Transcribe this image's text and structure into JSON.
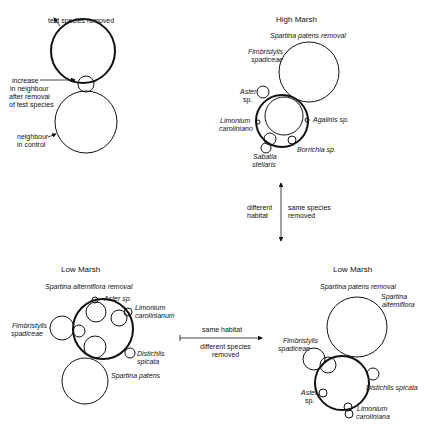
{
  "legend": {
    "test_species_removed": "test species removed",
    "increase_line1": "increase",
    "increase_line2": "in neighbour",
    "increase_line3": "after removal",
    "increase_line4": "of test species",
    "neighbour_line1": "neighbour",
    "neighbour_line2": "in control"
  },
  "high_marsh": {
    "title": "High Marsh",
    "removal": "Spartina patens removal",
    "species": {
      "fimbristylis_1": "Fimbristylis",
      "fimbristylis_2": "spadiceae",
      "aster_1": "Aster",
      "aster_2": "sp.",
      "limonium_1": "Limonium",
      "limonium_2": "caroliniano",
      "agalinis": "Agalinis  sp.",
      "borrichia": "Borrichia  sp.",
      "sabatia_1": "Sabatia",
      "sabatia_2": "stellaris"
    }
  },
  "vertical_arrow": {
    "left_1": "different",
    "left_2": "habitat",
    "right_1": "same species",
    "right_2": "removed"
  },
  "horizontal_arrow": {
    "top": "same habitat",
    "bottom_1": "different species",
    "bottom_2": "removed"
  },
  "low_marsh_left": {
    "title": "Low  Marsh",
    "removal": "Spartina alterniflora removal",
    "species": {
      "aster": "Aster  sp.",
      "limonium_1": "Limonium",
      "limonium_2": "carolinianum",
      "fimbristylis_1": "Fimbristylis",
      "fimbristylis_2": "spadiceae",
      "distichlis_1": "Distichlis",
      "distichlis_2": "spicata",
      "spartina_patens": "Spartina patens"
    }
  },
  "low_marsh_right": {
    "title": "Low  Marsh",
    "removal": "Spartina patens removal",
    "species": {
      "spartina_1": "Spartina",
      "spartina_2": "alterniflora",
      "fimbristylis_1": "Fimbristylis",
      "fimbristylis_2": "spadiceae",
      "distichlis": "Distichlis spicata",
      "aster_1": "Aster",
      "aster_2": "sp.",
      "limonium_1": "Limonium",
      "limonium_2": "caroliniana"
    }
  },
  "colors": {
    "ink": "#111111",
    "background": "#ffffff"
  }
}
